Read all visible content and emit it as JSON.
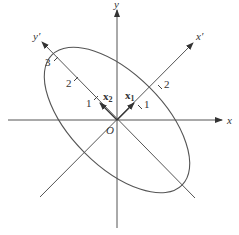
{
  "diagram": {
    "axes": {
      "x_label": "x",
      "y_label": "y",
      "x_prime_label": "x′",
      "y_prime_label": "y′",
      "origin_label": "O"
    },
    "vectors": {
      "x1_label": "x",
      "x1_sub": "1",
      "x2_label": "x",
      "x2_sub": "2"
    },
    "ticks": {
      "x_prime": [
        "1",
        "2"
      ],
      "y_prime": [
        "1",
        "2",
        "3"
      ]
    },
    "colors": {
      "stroke": "#444444",
      "text": "#333333",
      "background": "#ffffff"
    }
  }
}
